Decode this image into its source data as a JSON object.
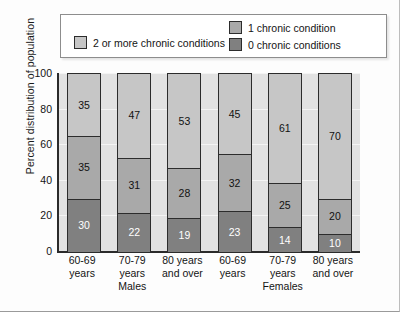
{
  "chart_data": {
    "type": "bar",
    "subtype": "stacked-bar-100pct",
    "title": "",
    "xlabel": "",
    "ylabel": "Percent distribution of population",
    "ylim": [
      0,
      100
    ],
    "yticks": [
      0,
      20,
      40,
      60,
      80,
      100
    ],
    "grid": true,
    "legend_position": "top-inside",
    "categories": [
      "60-69 years",
      "70-79 years",
      "80 years and over",
      "60-69 years",
      "70-79 years",
      "80 years and over"
    ],
    "category_lines": [
      [
        "60-69",
        "years"
      ],
      [
        "70-79",
        "years"
      ],
      [
        "80 years",
        "and over"
      ],
      [
        "60-69",
        "years"
      ],
      [
        "70-79",
        "years"
      ],
      [
        "80 years",
        "and over"
      ]
    ],
    "groups": [
      {
        "label": "Males",
        "categories": [
          0,
          1,
          2
        ]
      },
      {
        "label": "Females",
        "categories": [
          3,
          4,
          5
        ]
      }
    ],
    "series": [
      {
        "name": "0 chronic conditions",
        "color": "#808080",
        "values": [
          30,
          22,
          19,
          23,
          14,
          10
        ]
      },
      {
        "name": "1 chronic condition",
        "color": "#a9a9a9",
        "values": [
          35,
          31,
          28,
          32,
          25,
          20
        ]
      },
      {
        "name": "2 or more chronic conditions",
        "color": "#c6c6c6",
        "values": [
          35,
          47,
          53,
          45,
          61,
          70
        ]
      }
    ]
  },
  "legend": {
    "entries": [
      {
        "label": "2 or more chronic conditions",
        "color": "#c6c6c6"
      },
      {
        "label": "1 chronic condition",
        "color": "#a9a9a9"
      },
      {
        "label": "0 chronic conditions",
        "color": "#808080"
      }
    ]
  }
}
